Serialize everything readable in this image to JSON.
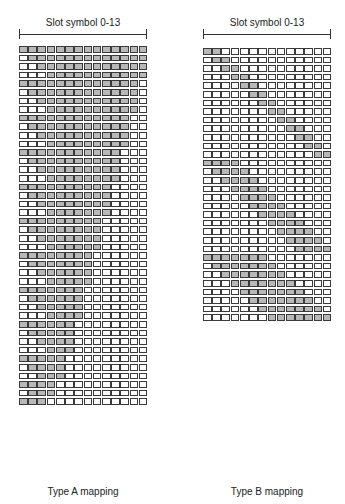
{
  "panels": [
    {
      "id": "type-a",
      "header": "Slot symbol 0-13",
      "caption": "Type A mapping",
      "num_symbols": 14,
      "start_symbols": [
        0,
        1,
        2,
        3
      ],
      "min_length": 3
    },
    {
      "id": "type-b",
      "header": "Slot symbol 0-13",
      "caption": "Type B mapping",
      "num_symbols": 14,
      "lengths": [
        2,
        4,
        7
      ]
    }
  ],
  "colors": {
    "allocated": "#b8b8b8",
    "free": "#ffffff",
    "border": "#3a3a3a"
  }
}
